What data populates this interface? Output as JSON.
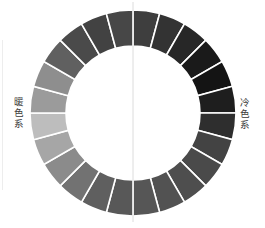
{
  "diagram": {
    "type": "color-wheel-ring",
    "segment_count": 24,
    "labels": {
      "warm": "暖色系",
      "cool": "冷色系"
    },
    "segments": [
      "#3e3e3e",
      "#333333",
      "#272727",
      "#1a1a1a",
      "#141414",
      "#1e1e1e",
      "#2e2e2e",
      "#434343",
      "#4a4a4a",
      "#4e4e4e",
      "#525252",
      "#565656",
      "#585858",
      "#5f5f5f",
      "#727272",
      "#8b8b8b",
      "#a6a6a6",
      "#bdbdbd",
      "#9b9b9b",
      "#8e8e8e",
      "#606060",
      "#4a4a4a",
      "#424242",
      "#474747"
    ],
    "divider_color": "#ffffff",
    "axis_line_color": "#dcdcdc"
  }
}
